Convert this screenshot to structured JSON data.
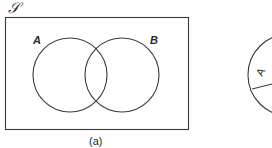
{
  "figure_a": {
    "universe_label": "𝒮",
    "set_a_label": "A",
    "set_b_label": "B",
    "caption": "(a)"
  },
  "figure_b_partial": {
    "region_label": "A"
  },
  "colors": {
    "line": "#3a3a3a",
    "text": "#2a2a2a",
    "background": "#ffffff"
  }
}
